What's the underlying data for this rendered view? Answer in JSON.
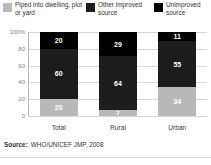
{
  "legend": {
    "items": [
      {
        "label": "Piped into dwelling, plot or yard",
        "color": "#b9b9b9",
        "key": "piped"
      },
      {
        "label": "Other improved source",
        "color": "#1c1c1c",
        "key": "other_improved"
      },
      {
        "label": "Unimproved source",
        "color": "#000000",
        "key": "unimproved"
      }
    ]
  },
  "source": {
    "prefix": "Source:",
    "text": "WHO/UNICEF JMP, 2008"
  },
  "chart_data": {
    "type": "bar",
    "stacked": true,
    "title": "",
    "xlabel": "",
    "ylabel": "",
    "categories": [
      "Total",
      "Rural",
      "Urban"
    ],
    "ylim": [
      0,
      100
    ],
    "yticks": [
      "0",
      "20",
      "40",
      "60",
      "80",
      "100%"
    ],
    "ytick_values": [
      0,
      20,
      40,
      60,
      80,
      100
    ],
    "grid": true,
    "legend_position": "top",
    "series": [
      {
        "name": "Piped into dwelling, plot or yard",
        "color": "#b9b9b9",
        "values": [
          20,
          7,
          34
        ]
      },
      {
        "name": "Other improved source",
        "color": "#1c1c1c",
        "values": [
          60,
          64,
          55
        ]
      },
      {
        "name": "Unimproved source",
        "color": "#000000",
        "values": [
          20,
          29,
          11
        ]
      }
    ]
  }
}
